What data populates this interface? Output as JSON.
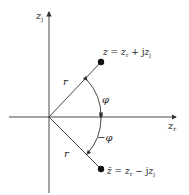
{
  "figure": {
    "type": "complex-plane-conjugate",
    "axes": {
      "vertical_label": "z",
      "vertical_sub": "j",
      "horizontal_label": "z",
      "horizontal_sub": "r"
    },
    "points": [
      {
        "id": "z",
        "label": "z = z",
        "sub1": "r",
        "mid": " + j",
        "var2": "z",
        "sub2": "j"
      },
      {
        "id": "z_conj",
        "label": "z̄ = z",
        "sub1": "r",
        "mid": " − j",
        "var2": "z",
        "sub2": "j"
      }
    ],
    "radius_label": "r",
    "angle_label": "φ",
    "neg_angle_label": "−φ",
    "colors": {
      "line": "#333333",
      "point": "#111111",
      "background": "#ffffff"
    }
  }
}
